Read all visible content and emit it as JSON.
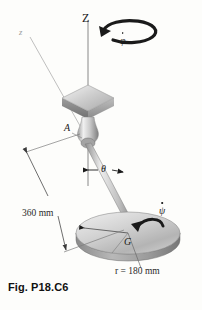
{
  "figure": {
    "caption": "Fig. P18.C6",
    "background_color": "#fdfdfb",
    "ink_color": "#1a1a1a"
  },
  "labels": {
    "precession_axis": "Z",
    "body_axis": "z",
    "pivot_point": "A",
    "mass_center": "G",
    "nutation_angle": "θ",
    "precession_rate": "φ",
    "spin_rate": "ψ",
    "rod_length": "360 mm",
    "disk_radius": "r = 180 mm"
  },
  "geometry": {
    "pivot": {
      "x": 88,
      "y": 139
    },
    "disk_center": {
      "x": 128,
      "y": 233
    },
    "disk_rx": 52,
    "disk_ry": 21,
    "disk_thickness": 7,
    "plate_center": {
      "x": 88,
      "y": 95
    },
    "plate_half_width": 26,
    "plate_half_depth": 11,
    "plate_thickness": 8,
    "z_axis_top": {
      "x": 88,
      "y": 18
    },
    "z_axis_bottom": {
      "x": 88,
      "y": 185
    },
    "body_axis_label": {
      "x": 22,
      "y": 34
    },
    "rod_end": {
      "x": 136,
      "y": 228
    }
  },
  "colors": {
    "metal_light": "#f2f2f2",
    "metal_mid": "#c9c9c9",
    "metal_dark": "#8f8f8f",
    "metal_shadow": "#6e6e6e",
    "disk_top": "#d9d9d9",
    "disk_edge": "#a5a5a5",
    "line": "#555555",
    "thin_line": "#9a9a9a"
  }
}
